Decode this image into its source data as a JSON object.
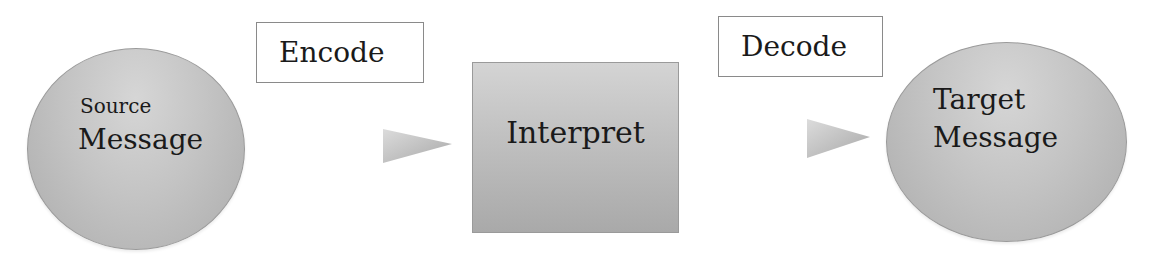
{
  "diagram": {
    "type": "flow",
    "nodes": [
      {
        "id": "source",
        "shape": "ellipse",
        "line1": "Source",
        "line2": "Message"
      },
      {
        "id": "interpret",
        "shape": "rectangle",
        "label": "Interpret"
      },
      {
        "id": "target",
        "shape": "ellipse",
        "line1": "Target",
        "line2": "Message"
      }
    ],
    "edges": [
      {
        "from": "source",
        "to": "interpret",
        "label": "Encode"
      },
      {
        "from": "interpret",
        "to": "target",
        "label": "Decode"
      }
    ],
    "colors": {
      "node_fill_light": "#d6d6d6",
      "node_fill_dark": "#a9a9a9",
      "border": "#8a8a8a",
      "text": "#1a1a1a",
      "background": "#ffffff"
    }
  }
}
